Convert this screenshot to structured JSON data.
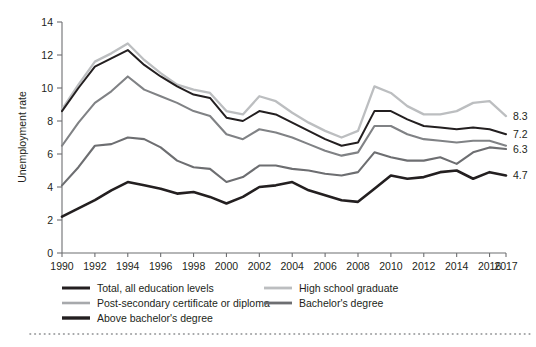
{
  "chart_data": {
    "type": "line",
    "title": "",
    "xlabel": "",
    "ylabel": "Unemployment rate",
    "ylim": [
      0,
      14
    ],
    "yticks": [
      0,
      2,
      4,
      6,
      8,
      10,
      12,
      14
    ],
    "grid": false,
    "legend_position": "bottom",
    "x": [
      1990,
      1991,
      1992,
      1993,
      1994,
      1995,
      1996,
      1997,
      1998,
      1999,
      2000,
      2001,
      2002,
      2003,
      2004,
      2005,
      2006,
      2007,
      2008,
      2009,
      2010,
      2011,
      2012,
      2013,
      2014,
      2015,
      2016,
      2017
    ],
    "xtick_labels": [
      "1990",
      "1992",
      "1994",
      "1996",
      "1998",
      "2000",
      "2002",
      "2004",
      "2006",
      "2008",
      "2010",
      "2012",
      "2014",
      "2016",
      "2017"
    ],
    "xtick_values": [
      1990,
      1992,
      1994,
      1996,
      1998,
      2000,
      2002,
      2004,
      2006,
      2008,
      2010,
      2012,
      2014,
      2016,
      2017
    ],
    "series": [
      {
        "name": "High school graduate",
        "color": "#bcbec0",
        "width": 2.3,
        "end_label": "8.3",
        "values": [
          8.7,
          10.2,
          11.6,
          12.1,
          12.7,
          11.7,
          10.9,
          10.2,
          9.9,
          9.7,
          8.6,
          8.4,
          9.5,
          9.2,
          8.5,
          7.9,
          7.4,
          7.0,
          7.4,
          10.1,
          9.7,
          8.9,
          8.4,
          8.4,
          8.6,
          9.1,
          9.2,
          8.3
        ]
      },
      {
        "name": "Total, all education levels",
        "color": "#231f20",
        "width": 2.0,
        "end_label": "7.2",
        "values": [
          8.6,
          10.0,
          11.3,
          11.8,
          12.3,
          11.4,
          10.7,
          10.1,
          9.6,
          9.4,
          8.2,
          8.0,
          8.6,
          8.4,
          7.9,
          7.4,
          6.9,
          6.5,
          6.7,
          8.6,
          8.6,
          8.1,
          7.7,
          7.6,
          7.5,
          7.6,
          7.5,
          7.2
        ]
      },
      {
        "name": "Post-secondary certificate or diploma",
        "color": "#808285",
        "width": 2.1,
        "end_label": null,
        "values": [
          6.5,
          7.9,
          9.1,
          9.8,
          10.7,
          9.9,
          9.5,
          9.1,
          8.6,
          8.3,
          7.2,
          6.9,
          7.5,
          7.3,
          7.0,
          6.6,
          6.2,
          5.9,
          6.1,
          7.7,
          7.7,
          7.2,
          6.9,
          6.8,
          6.7,
          6.8,
          6.8,
          6.5
        ]
      },
      {
        "name": "Bachelor's degree",
        "color": "#6d6e71",
        "width": 2.1,
        "end_label": "6.3",
        "values": [
          4.1,
          5.2,
          6.5,
          6.6,
          7.0,
          6.9,
          6.4,
          5.6,
          5.2,
          5.1,
          4.3,
          4.6,
          5.3,
          5.3,
          5.1,
          5.0,
          4.8,
          4.7,
          4.9,
          6.1,
          5.8,
          5.6,
          5.6,
          5.8,
          5.4,
          6.1,
          6.4,
          6.3
        ]
      },
      {
        "name": "Above bachelor's degree",
        "color": "#231f20",
        "width": 2.6,
        "end_label": "4.7",
        "values": [
          2.2,
          2.7,
          3.2,
          3.8,
          4.3,
          4.1,
          3.9,
          3.6,
          3.7,
          3.4,
          3.0,
          3.4,
          4.0,
          4.1,
          4.3,
          3.8,
          3.5,
          3.2,
          3.1,
          3.9,
          4.7,
          4.5,
          4.6,
          4.9,
          5.0,
          4.5,
          4.9,
          4.7
        ]
      }
    ],
    "end_labels": [
      {
        "text": "8.3",
        "value": 8.3
      },
      {
        "text": "7.2",
        "value": 7.2
      },
      {
        "text": "6.3",
        "value": 6.3
      },
      {
        "text": "4.7",
        "value": 4.7
      }
    ]
  },
  "legend": {
    "column_left": [
      {
        "label": "Total, all education levels",
        "color": "#231f20",
        "width": 3.0
      },
      {
        "label": "Post-secondary certificate or diploma",
        "color": "#a7a9ac",
        "width": 2.6
      },
      {
        "label": "Above bachelor's degree",
        "color": "#231f20",
        "width": 3.4
      }
    ],
    "column_right": [
      {
        "label": "High school graduate",
        "color": "#bcbec0",
        "width": 2.8
      },
      {
        "label": "Bachelor's degree",
        "color": "#6d6e71",
        "width": 2.8
      }
    ]
  },
  "footer": {
    "separator": "dotted-rule"
  }
}
